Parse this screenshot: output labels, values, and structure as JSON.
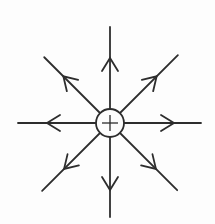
{
  "figure": {
    "title": "",
    "background_color": "#fdfdfd",
    "line_color": "#2d2d2d",
    "width": 215,
    "height": 224,
    "charge": {
      "symbol": "+",
      "center_x": 110,
      "center_y": 123,
      "circle_radius": 14,
      "plus_half_length": 8
    },
    "style": {
      "ray_stroke_width": 1.8,
      "circle_stroke_width": 1.8,
      "plus_stroke_width": 1.3,
      "arrow_barb_length": 13,
      "arrow_barb_half_width": 8
    },
    "rays": [
      {
        "direction": "up",
        "angle_deg": -90,
        "length": 96,
        "arrow_distance": 65
      },
      {
        "direction": "up-right",
        "angle_deg": -45,
        "length": 96,
        "arrow_distance": 66
      },
      {
        "direction": "right",
        "angle_deg": 0,
        "length": 91,
        "arrow_distance": 64
      },
      {
        "direction": "down-right",
        "angle_deg": 45,
        "length": 95,
        "arrow_distance": 65
      },
      {
        "direction": "down",
        "angle_deg": 90,
        "length": 94,
        "arrow_distance": 67
      },
      {
        "direction": "down-left",
        "angle_deg": 135,
        "length": 96,
        "arrow_distance": 65
      },
      {
        "direction": "left",
        "angle_deg": 180,
        "length": 92,
        "arrow_distance": 63
      },
      {
        "direction": "up-left",
        "angle_deg": -135,
        "length": 93,
        "arrow_distance": 66
      }
    ]
  }
}
